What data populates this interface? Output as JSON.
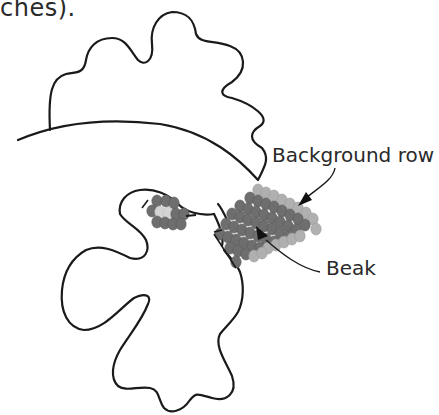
{
  "caption": {
    "fragment": "ches)."
  },
  "labels": {
    "background_row": "Background row",
    "beak": "Beak"
  },
  "colors": {
    "outline": "#1a1a1a",
    "bead_dark": "#6e6e6e",
    "bead_light": "#b0b0b0",
    "bead_eye_highlight": "#d4d4d4",
    "background": "#ffffff"
  },
  "figure": {
    "callouts": [
      {
        "label": "Background row",
        "target": "light bead row along top edge of beak"
      },
      {
        "label": "Beak",
        "target": "dark bead triangle"
      }
    ]
  }
}
